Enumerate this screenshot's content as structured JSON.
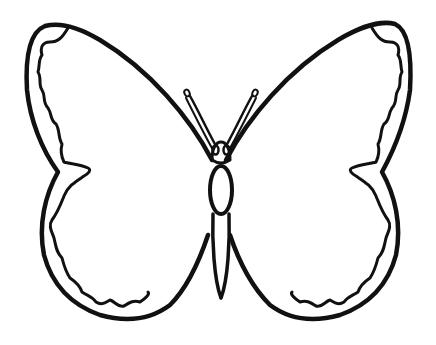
{
  "image": {
    "subject": "butterfly line-art coloring outline",
    "background": "#ffffff",
    "line_color": "#111111"
  }
}
